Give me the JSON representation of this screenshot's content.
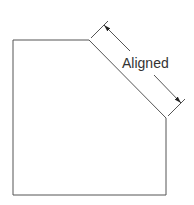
{
  "diagram": {
    "type": "aligned-dimension-illustration",
    "shape": {
      "name": "chamfered-rectangle",
      "points": [
        [
          13,
          40
        ],
        [
          89,
          40
        ],
        [
          166,
          118
        ],
        [
          166,
          195
        ],
        [
          13,
          195
        ]
      ],
      "stroke": "#555555"
    },
    "dimension": {
      "label": "Aligned",
      "extension_lines": [
        {
          "from": [
            91,
            38
          ],
          "to": [
            108,
            21
          ]
        },
        {
          "from": [
            168,
            116
          ],
          "to": [
            185,
            99
          ]
        }
      ],
      "dimension_line": {
        "from": [
          104,
          25
        ],
        "to": [
          181,
          103
        ],
        "gap_for_text": true
      },
      "arrow_color": "#222222",
      "line_color": "#555555"
    }
  }
}
